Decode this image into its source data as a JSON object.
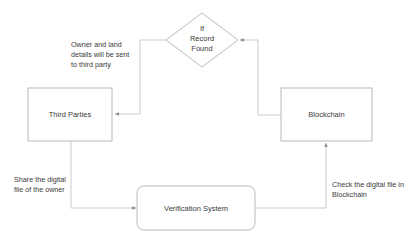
{
  "diagram": {
    "nodes": {
      "decision": {
        "shape": "diamond",
        "lines": [
          "If",
          "Record",
          "Found"
        ]
      },
      "third_parties": {
        "shape": "rectangle",
        "label": "Third Parties"
      },
      "blockchain": {
        "shape": "rectangle",
        "label": "Blockchain"
      },
      "verification": {
        "shape": "rounded-rectangle",
        "label": "Verification System"
      }
    },
    "edges": [
      {
        "from": "third_parties",
        "to": "verification"
      },
      {
        "from": "verification",
        "to": "blockchain"
      },
      {
        "from": "blockchain",
        "to": "decision"
      },
      {
        "from": "decision",
        "to": "third_parties"
      }
    ],
    "annotations": {
      "decision_to_third_parties": [
        "Owner and land",
        "details will be sent",
        "to third party"
      ],
      "third_parties_to_verification": [
        "Share the digital",
        "file of the owner"
      ],
      "verification_to_blockchain": [
        "Check the digital file in",
        "Blockchain"
      ]
    },
    "colors": {
      "node_border": "#a8a8a8",
      "connector": "#b4b4b4",
      "text": "#3a3a3a",
      "background": "#ffffff"
    }
  }
}
